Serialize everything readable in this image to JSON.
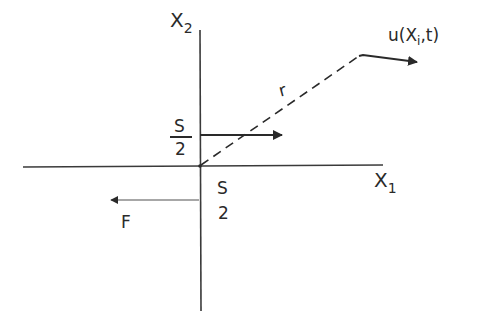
{
  "diagram": {
    "type": "coordinate-sketch",
    "labels": {
      "x2_axis": {
        "base": "X",
        "sub": "2"
      },
      "x1_axis": {
        "base": "X",
        "sub": "1"
      },
      "displacement": {
        "prefix": "u(X",
        "sub": "i",
        "suffix": ",t)"
      },
      "radius": "r",
      "upper_slip_num": "S",
      "upper_slip_den": "2",
      "lower_slip_num": "S",
      "lower_slip_den": "2",
      "force": "F"
    },
    "colors": {
      "ink": "#2a2a2a",
      "axis": "#3a3a3a",
      "force_arrow": "#8a8a8a",
      "background": "#ffffff"
    }
  }
}
